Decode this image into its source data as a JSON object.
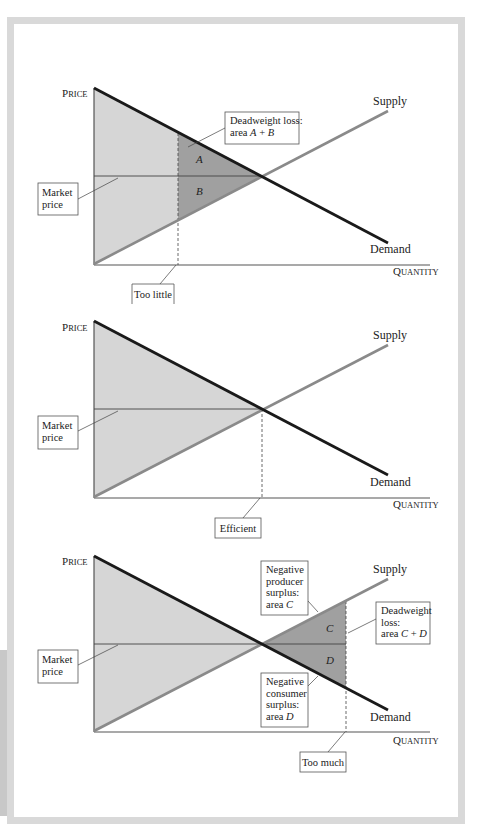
{
  "colors": {
    "frame": "#d9d9d9",
    "light_fill": "#d6d6d6",
    "dark_fill": "#a0a0a0",
    "demand_line": "#1a1a1a",
    "supply_line": "#8a8a8a",
    "axis": "#555555"
  },
  "axis_labels": {
    "price": {
      "first": "P",
      "rest": "RICE"
    },
    "quantity": {
      "first": "Q",
      "rest": "UANTITY"
    }
  },
  "curve_labels": {
    "supply": "Supply",
    "demand": "Demand"
  },
  "charts": [
    {
      "id": "too-little",
      "axis_origin": [
        94,
        265
      ],
      "axis_end_x": 430,
      "axis_top_y": 88,
      "demand": [
        [
          94,
          88
        ],
        [
          388,
          243
        ]
      ],
      "supply": [
        [
          94,
          264
        ],
        [
          388,
          111
        ]
      ],
      "equilibrium": [
        262,
        176
      ],
      "quantity_marker_x": 178,
      "demand_at_marker_y": 133,
      "supply_at_marker_y": 220,
      "price_label_pos": [
        62,
        97
      ],
      "quantity_label_pos": [
        393,
        275
      ],
      "supply_label_pos": [
        373,
        105
      ],
      "demand_label_pos": [
        370,
        253
      ],
      "market_price_box": {
        "x": 38,
        "y": 183,
        "w": 40,
        "h": 32,
        "lines": [
          "Market",
          "price"
        ],
        "leader": [
          [
            78,
            199
          ],
          [
            118,
            178
          ]
        ]
      },
      "annotation_boxes": [
        {
          "name": "deadweight-loss-box",
          "x": 225,
          "y": 112,
          "w": 74,
          "h": 32,
          "lines": [
            "Deadweight loss:",
            "area A + B"
          ],
          "leader": [
            [
              225,
              128
            ],
            [
              188,
              147
            ]
          ]
        }
      ],
      "marker_box": {
        "name": "too-little-box",
        "x": 132,
        "y": 284,
        "w": 42,
        "h": 20,
        "text": "Too little",
        "open_bottom": true,
        "leader": [
          [
            176,
            265
          ],
          [
            160,
            284
          ]
        ]
      },
      "area_labels": [
        {
          "text": "A",
          "pos": [
            196,
            163
          ]
        },
        {
          "text": "B",
          "pos": [
            196,
            195
          ]
        }
      ],
      "dark_regions": [
        [
          [
            178,
            133
          ],
          [
            262,
            176
          ],
          [
            178,
            220
          ]
        ]
      ]
    },
    {
      "id": "efficient",
      "axis_origin": [
        94,
        498
      ],
      "axis_end_x": 430,
      "axis_top_y": 321,
      "demand": [
        [
          94,
          321
        ],
        [
          388,
          475
        ]
      ],
      "supply": [
        [
          94,
          497
        ],
        [
          388,
          345
        ]
      ],
      "equilibrium": [
        262,
        409
      ],
      "quantity_marker_x": 262,
      "price_label_pos": [
        62,
        331
      ],
      "quantity_label_pos": [
        393,
        508
      ],
      "supply_label_pos": [
        373,
        339
      ],
      "demand_label_pos": [
        370,
        486
      ],
      "market_price_box": {
        "x": 38,
        "y": 416,
        "w": 40,
        "h": 33,
        "lines": [
          "Market",
          "price"
        ],
        "leader": [
          [
            78,
            431
          ],
          [
            118,
            411
          ]
        ]
      },
      "annotation_boxes": [],
      "marker_box": {
        "name": "efficient-box",
        "x": 215,
        "y": 518,
        "w": 46,
        "h": 20,
        "text": "Efficient",
        "open_bottom": false,
        "leader": [
          [
            260,
            498
          ],
          [
            243,
            518
          ]
        ]
      },
      "area_labels": [],
      "dark_regions": []
    },
    {
      "id": "too-much",
      "axis_origin": [
        94,
        732
      ],
      "axis_end_x": 430,
      "axis_top_y": 556,
      "demand": [
        [
          94,
          556
        ],
        [
          388,
          710
        ]
      ],
      "supply": [
        [
          94,
          731
        ],
        [
          388,
          579
        ]
      ],
      "equilibrium": [
        262,
        644
      ],
      "quantity_marker_x": 346,
      "demand_at_marker_y": 687,
      "supply_at_marker_y": 601,
      "price_label_pos": [
        62,
        565
      ],
      "quantity_label_pos": [
        393,
        744
      ],
      "supply_label_pos": [
        373,
        573
      ],
      "demand_label_pos": [
        370,
        721
      ],
      "market_price_box": {
        "x": 38,
        "y": 650,
        "w": 40,
        "h": 33,
        "lines": [
          "Market",
          "price"
        ],
        "leader": [
          [
            78,
            665
          ],
          [
            118,
            645
          ]
        ]
      },
      "annotation_boxes": [
        {
          "name": "negative-producer-surplus-box",
          "x": 261,
          "y": 561,
          "w": 47,
          "h": 54,
          "lines": [
            "Negative",
            "producer",
            "surplus:",
            "area C"
          ],
          "leader": [
            [
              308,
              601
            ],
            [
              318,
              612
            ]
          ]
        },
        {
          "name": "deadweight-loss-box",
          "x": 376,
          "y": 602,
          "w": 54,
          "h": 42,
          "lines": [
            "Deadweight",
            "loss:",
            "area C + D"
          ],
          "leader": [
            [
              376,
              619
            ],
            [
              348,
              633
            ]
          ]
        },
        {
          "name": "negative-consumer-surplus-box",
          "x": 261,
          "y": 673,
          "w": 47,
          "h": 54,
          "lines": [
            "Negative",
            "consumer",
            "surplus:",
            "area D"
          ],
          "leader": [
            [
              308,
              686
            ],
            [
              318,
              676
            ]
          ]
        }
      ],
      "marker_box": {
        "name": "too-much-box",
        "x": 300,
        "y": 752,
        "w": 46,
        "h": 20,
        "text": "Too much",
        "open_bottom": false,
        "leader": [
          [
            345,
            732
          ],
          [
            328,
            752
          ]
        ]
      },
      "area_labels": [
        {
          "text": "C",
          "pos": [
            326,
            632
          ]
        },
        {
          "text": "D",
          "pos": [
            326,
            664
          ]
        }
      ],
      "dark_regions": [
        [
          [
            262,
            644
          ],
          [
            346,
            601
          ],
          [
            346,
            687
          ]
        ]
      ]
    }
  ]
}
